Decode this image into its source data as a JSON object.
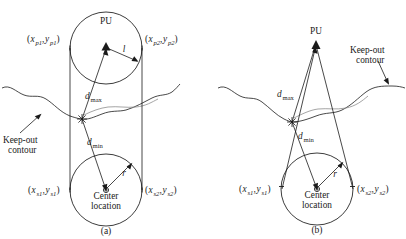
{
  "figure": {
    "type": "technical-diagram",
    "stroke_color": "#1a1a1a",
    "background_color": "#ffffff"
  },
  "panels": [
    {
      "id": "a",
      "caption": "(a)",
      "labels": {
        "pu": "PU",
        "radius_pu": "l",
        "radius_center": "r",
        "d_max": "d",
        "d_max_sub": "max",
        "d_min": "d",
        "d_min_sub": "min",
        "keep_out_line1": "Keep-out",
        "keep_out_line2": "contour",
        "center_line1": "Center",
        "center_line2": "location",
        "p1_open": "(",
        "p1_x": "x",
        "p1_xsub": "p1",
        "p1_comma": ",",
        "p1_y": "y",
        "p1_ysub": "p1",
        "p1_close": ")",
        "p2_x": "x",
        "p2_xsub": "p2",
        "p2_y": "y",
        "p2_ysub": "p2",
        "s1_x": "x",
        "s1_xsub": "s1",
        "s1_y": "y",
        "s1_ysub": "s1",
        "s2_x": "x",
        "s2_xsub": "s2",
        "s2_y": "y",
        "s2_ysub": "s2"
      }
    },
    {
      "id": "b",
      "caption": "(b)",
      "labels": {
        "pu": "PU",
        "radius_center": "r",
        "d_max": "d",
        "d_max_sub": "max",
        "d_min": "d",
        "d_min_sub": "min",
        "keep_out_line1": "Keep-out",
        "keep_out_line2": "contour",
        "center_line1": "Center",
        "center_line2": "location",
        "s1_x": "x",
        "s1_xsub": "s1",
        "s1_y": "y",
        "s1_ysub": "s1",
        "s2_x": "x",
        "s2_xsub": "s2",
        "s2_y": "y",
        "s2_ysub": "s2"
      }
    }
  ],
  "punctuation": {
    "open_paren": "(",
    "close_paren": ")",
    "comma": ","
  }
}
